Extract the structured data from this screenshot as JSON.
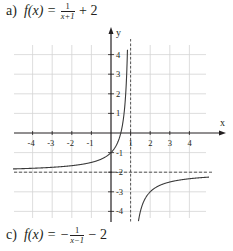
{
  "labels": {
    "top": {
      "part": "a)",
      "lhs": "f(x) = ",
      "frac_num": "1",
      "frac_den": "x+1",
      "tail": " + 2"
    },
    "bottom": {
      "part": "c)",
      "lhs": "f(x) = −",
      "frac_num": "1",
      "frac_den": "x−1",
      "tail": " − 2"
    }
  },
  "colors": {
    "curve": "#3a3a3a",
    "grid": "#d4d4d4",
    "axis": "#231f20",
    "asymptote": "#444444"
  },
  "chart_data": {
    "type": "line",
    "xlabel": "x",
    "ylabel": "y",
    "xlim": [
      -5.5,
      5.5
    ],
    "ylim": [
      -4.5,
      4.5
    ],
    "grid": true,
    "x_ticks": [
      -4,
      -3,
      -2,
      -1,
      1,
      2,
      3,
      4
    ],
    "y_ticks": [
      4,
      3,
      2,
      1,
      -1,
      -2,
      -3,
      -4
    ],
    "asymptotes": {
      "vertical": 1,
      "horizontal": -2
    },
    "series": [
      {
        "name": "f(x) = -1/(x-1) - 2",
        "function": "-1/(x-1)-2",
        "points_left_branch": [
          [
            -5.5,
            -1.846
          ],
          [
            -4,
            -1.8
          ],
          [
            -3,
            -1.75
          ],
          [
            -2,
            -1.667
          ],
          [
            -1,
            -1.5
          ],
          [
            0,
            -1
          ],
          [
            0.5,
            0
          ],
          [
            0.75,
            2
          ],
          [
            0.8,
            3
          ],
          [
            0.85,
            4.667
          ]
        ],
        "points_right_branch": [
          [
            1.2,
            -7
          ],
          [
            1.4,
            -4.5
          ],
          [
            2,
            -3
          ],
          [
            3,
            -2.5
          ],
          [
            4,
            -2.333
          ],
          [
            5.5,
            -2.222
          ]
        ]
      }
    ]
  }
}
